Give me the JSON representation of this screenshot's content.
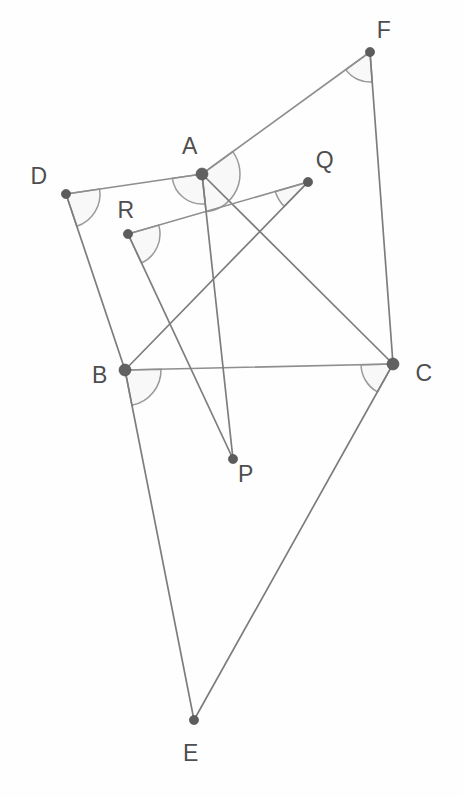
{
  "figure": {
    "background_color": "#fefefe",
    "line_color": "#7d7d7d",
    "arc_color": "#9a9a9a",
    "vertex_color": "#5c5c5c",
    "label_color": "#4e4e4e",
    "width": 463,
    "height": 797
  },
  "points": [
    {
      "id": "A",
      "label": "A",
      "x": 202,
      "y": 174,
      "r": 6.0,
      "label_x": 190,
      "label_y": 148
    },
    {
      "id": "B",
      "label": "B",
      "x": 125,
      "y": 370,
      "r": 6.0,
      "label_x": 100,
      "label_y": 377
    },
    {
      "id": "C",
      "label": "C",
      "x": 393,
      "y": 364,
      "r": 6.0,
      "label_x": 424,
      "label_y": 375
    },
    {
      "id": "D",
      "label": "D",
      "x": 66,
      "y": 194,
      "r": 4.6,
      "label_x": 39,
      "label_y": 178
    },
    {
      "id": "E",
      "label": "E",
      "x": 194,
      "y": 720,
      "r": 4.6,
      "label_x": 191,
      "label_y": 755
    },
    {
      "id": "F",
      "label": "F",
      "x": 370,
      "y": 52,
      "r": 4.6,
      "label_x": 384,
      "label_y": 32
    },
    {
      "id": "P",
      "label": "P",
      "x": 233,
      "y": 459,
      "r": 4.6,
      "label_x": 246,
      "label_y": 476
    },
    {
      "id": "Q",
      "label": "Q",
      "x": 308,
      "y": 182,
      "r": 4.6,
      "label_x": 325,
      "label_y": 162
    },
    {
      "id": "R",
      "label": "R",
      "x": 128,
      "y": 234,
      "r": 4.6,
      "label_x": 126,
      "label_y": 212
    }
  ],
  "segments": [
    {
      "id": "DA",
      "from": "D",
      "to": "A",
      "style": "light"
    },
    {
      "id": "AF",
      "from": "A",
      "to": "F",
      "style": "light"
    },
    {
      "id": "FC",
      "from": "F",
      "to": "C",
      "style": "normal"
    },
    {
      "id": "DB",
      "from": "D",
      "to": "B",
      "style": "normal"
    },
    {
      "id": "BC",
      "from": "B",
      "to": "C",
      "style": "light"
    },
    {
      "id": "AC",
      "from": "A",
      "to": "C",
      "style": "normal"
    },
    {
      "id": "BE",
      "from": "B",
      "to": "E",
      "style": "normal"
    },
    {
      "id": "CE",
      "from": "C",
      "to": "E",
      "style": "normal"
    },
    {
      "id": "RQ",
      "from": "R",
      "to": "Q",
      "style": "light"
    },
    {
      "id": "RP",
      "from": "R",
      "to": "P",
      "style": "normal"
    },
    {
      "id": "AP",
      "from": "A",
      "to": "P",
      "style": "normal"
    },
    {
      "id": "QB",
      "from": "Q",
      "to": "B",
      "style": "normal"
    }
  ],
  "angle_arcs": [
    {
      "id": "angle-A-right",
      "vertex": "A",
      "from": "F",
      "to": "P",
      "radius": 38
    },
    {
      "id": "angle-A-left",
      "vertex": "A",
      "from": "P",
      "to": "D",
      "radius": 30
    },
    {
      "id": "angle-D",
      "vertex": "D",
      "from": "A",
      "to": "B",
      "radius": 34
    },
    {
      "id": "angle-F",
      "vertex": "F",
      "from": "A",
      "to": "C",
      "radius": 30
    },
    {
      "id": "angle-B",
      "vertex": "B",
      "from": "C",
      "to": "E",
      "radius": 36
    },
    {
      "id": "angle-C",
      "vertex": "C",
      "from": "E",
      "to": "B",
      "radius": 32
    },
    {
      "id": "angle-R",
      "vertex": "R",
      "from": "Q",
      "to": "P",
      "radius": 32
    },
    {
      "id": "angle-Q",
      "vertex": "Q",
      "from": "B",
      "to": "R",
      "radius": 34
    }
  ],
  "chart_data": {
    "type": "scatter",
    "xlabel": "",
    "ylabel": "",
    "x": [
      202,
      125,
      393,
      66,
      194,
      370,
      233,
      308,
      128
    ],
    "y": [
      174,
      370,
      364,
      194,
      720,
      52,
      459,
      182,
      234
    ],
    "labels": [
      "A",
      "B",
      "C",
      "D",
      "E",
      "F",
      "P",
      "Q",
      "R"
    ],
    "xlim": [
      0,
      463
    ],
    "ylim": [
      797,
      0
    ],
    "grid": false,
    "legend": "none",
    "annotations": [
      "Segment D-A-F is a straight polyline bent at A",
      "Segment R-Q passes below A",
      "Marked angles at A (two), B, C, D, F, Q, R"
    ]
  }
}
